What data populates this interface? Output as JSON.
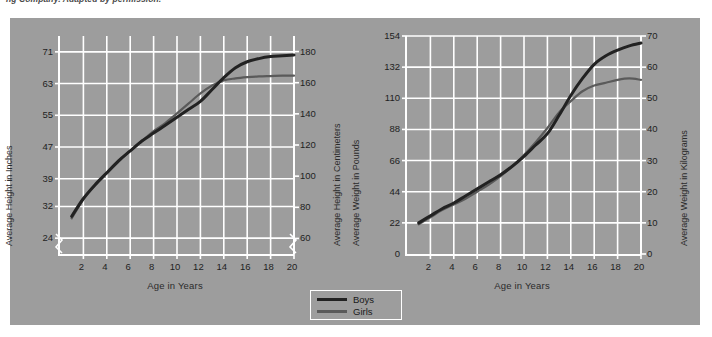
{
  "caption": "ng Company. Adapted by permission.",
  "colors": {
    "panel_background": "#9d9d9d",
    "gridline": "#ffffff",
    "axis": "#ffffff",
    "boys_line": "#222222",
    "girls_line": "#5a5a5a",
    "text": "#1f1f1f"
  },
  "legend": {
    "boys_label": "Boys",
    "girls_label": "Girls"
  },
  "chart_data": [
    {
      "type": "line",
      "title": "",
      "xlabel": "Age in  Years",
      "ylabel": "Average Height in Inches",
      "y2label": "Average Height in Centimeters",
      "xlim": [
        0,
        20
      ],
      "ylim": [
        20,
        75
      ],
      "y2lim": [
        50,
        190
      ],
      "grid": true,
      "axis_break": true,
      "legend_position": "bottom-center",
      "xticks": [
        2,
        4,
        6,
        8,
        10,
        12,
        14,
        16,
        18,
        20
      ],
      "yticks": [
        24,
        32,
        39,
        47,
        55,
        63,
        71
      ],
      "y2ticks": [
        60,
        80,
        100,
        120,
        140,
        160,
        180
      ],
      "x": [
        1,
        2,
        3,
        4,
        5,
        6,
        7,
        8,
        9,
        10,
        11,
        12,
        13,
        14,
        15,
        16,
        17,
        18,
        19,
        20
      ],
      "series": [
        {
          "name": "Boys",
          "values": [
            29.5,
            34.0,
            37.5,
            40.5,
            43.5,
            46.0,
            48.5,
            50.5,
            52.5,
            54.5,
            56.5,
            58.5,
            61.5,
            64.5,
            67.0,
            68.5,
            69.3,
            69.8,
            70.0,
            70.2
          ]
        },
        {
          "name": "Girls",
          "values": [
            29.0,
            33.8,
            37.3,
            40.3,
            43.3,
            46.0,
            48.5,
            51.0,
            53.0,
            55.5,
            58.0,
            60.5,
            62.5,
            63.8,
            64.3,
            64.6,
            64.8,
            64.9,
            65.0,
            65.0
          ]
        }
      ]
    },
    {
      "type": "line",
      "title": "",
      "xlabel": "Age in  Years",
      "ylabel": "Average Weight in Pounds",
      "y2label": "Average Weight in Kilograms",
      "xlim": [
        0,
        20
      ],
      "ylim": [
        0,
        154
      ],
      "y2lim": [
        0,
        70
      ],
      "grid": true,
      "axis_break": false,
      "legend_position": "bottom-center",
      "xticks": [
        2,
        4,
        6,
        8,
        10,
        12,
        14,
        16,
        18,
        20
      ],
      "yticks": [
        0,
        22,
        44,
        66,
        88,
        110,
        132,
        154
      ],
      "y2ticks": [
        0,
        10,
        20,
        30,
        40,
        50,
        60,
        70
      ],
      "x": [
        1,
        2,
        3,
        4,
        5,
        6,
        7,
        8,
        9,
        10,
        11,
        12,
        13,
        14,
        15,
        16,
        17,
        18,
        19,
        20
      ],
      "series": [
        {
          "name": "Boys",
          "values": [
            22,
            27,
            32,
            36,
            41,
            46,
            51,
            56,
            62,
            69,
            77,
            85,
            98,
            112,
            124,
            134,
            140,
            144,
            147,
            149
          ]
        },
        {
          "name": "Girls",
          "values": [
            21,
            26,
            31,
            35,
            39,
            44,
            49,
            55,
            62,
            70,
            79,
            89,
            100,
            108,
            115,
            119,
            121,
            123,
            124,
            123
          ]
        }
      ]
    }
  ]
}
